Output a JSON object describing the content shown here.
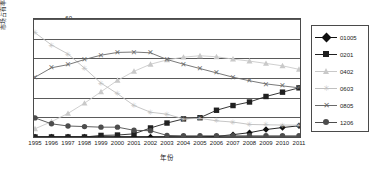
{
  "chart_data": {
    "type": "line",
    "title": "",
    "xlabel": "年份",
    "ylabel": "市场占有率/%",
    "xlim": [
      1995,
      2011
    ],
    "ylim": [
      0,
      60
    ],
    "yticks": [
      0,
      10,
      20,
      30,
      40,
      50,
      60
    ],
    "grid": true,
    "legend_position": "right",
    "categories": [
      "1995",
      "1996",
      "1997",
      "1998",
      "1999",
      "2000",
      "2001",
      "2002",
      "2003",
      "2004",
      "2005",
      "2006",
      "2007",
      "2008",
      "2009",
      "2010",
      "2011"
    ],
    "series": [
      {
        "name": "01005",
        "marker": "diamond",
        "color": "#101010",
        "values": [
          0,
          0,
          0,
          0,
          0,
          0,
          0,
          0,
          0,
          0,
          0,
          0.3,
          1.2,
          2.2,
          3.8,
          4.8,
          5.7
        ]
      },
      {
        "name": "0201",
        "marker": "square",
        "color": "#202020",
        "values": [
          0,
          0,
          0,
          0,
          0.8,
          1.0,
          1.6,
          4.6,
          7.1,
          9.2,
          9.8,
          13.6,
          16.0,
          17.8,
          20.6,
          22.8,
          25.0
        ]
      },
      {
        "name": "0402",
        "marker": "triangle",
        "color": "#c9c9c9",
        "values": [
          4.2,
          7.8,
          12.0,
          17.2,
          23.0,
          28.8,
          33.4,
          37.0,
          39.2,
          40.6,
          41.3,
          40.8,
          39.6,
          38.6,
          37.4,
          36.2,
          34.4
        ]
      },
      {
        "name": "0603",
        "marker": "star",
        "color": "#c0c0c0",
        "values": [
          53.0,
          46.8,
          42.2,
          35.0,
          27.4,
          22.0,
          16.0,
          12.6,
          11.6,
          9.2,
          9.5,
          8.2,
          7.6,
          6.4,
          6.2,
          6.1,
          6.0
        ]
      },
      {
        "name": "0805",
        "marker": "x",
        "color": "#6a6a6a",
        "values": [
          30.4,
          35.2,
          36.8,
          39.4,
          41.6,
          43.0,
          43.2,
          42.8,
          39.4,
          37.0,
          34.8,
          32.6,
          30.4,
          28.6,
          27.0,
          26.0,
          25.0
        ]
      },
      {
        "name": "1206",
        "marker": "circle",
        "color": "#4d4d4d",
        "values": [
          9.7,
          6.7,
          5.6,
          5.3,
          5.0,
          5.0,
          3.4,
          3.2,
          0.8,
          0.6,
          0.6,
          0.6,
          0.6,
          0.6,
          0.6,
          0.6,
          0.6
        ]
      }
    ]
  }
}
